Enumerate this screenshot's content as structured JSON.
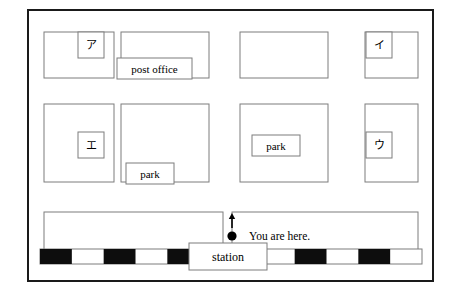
{
  "figure": {
    "question_number": "4",
    "type": "town-map-diagram",
    "frame": {
      "x": 28,
      "y": 10,
      "width": 405,
      "height": 271,
      "stroke": "#1a1a1a",
      "stroke_width": 2
    },
    "colors": {
      "block_outline": "#7d7d7d",
      "label_box_outline": "#7d7d7d",
      "frame": "#1a1a1a",
      "rail_dark": "#0d0d0d",
      "rail_light": "#ffffff",
      "marker": "#000000",
      "background": "#ffffff"
    }
  },
  "blocks": [
    {
      "name": "block-top-left",
      "x": 44,
      "y": 32,
      "width": 70,
      "height": 46
    },
    {
      "name": "block-top-center",
      "x": 121,
      "y": 32,
      "width": 88,
      "height": 46
    },
    {
      "name": "block-top-right-inner",
      "x": 240,
      "y": 32,
      "width": 88,
      "height": 46
    },
    {
      "name": "block-top-right",
      "x": 365,
      "y": 32,
      "width": 53,
      "height": 46
    },
    {
      "name": "block-mid-left",
      "x": 44,
      "y": 104,
      "width": 70,
      "height": 78
    },
    {
      "name": "block-mid-center",
      "x": 121,
      "y": 104,
      "width": 88,
      "height": 78
    },
    {
      "name": "block-mid-right-inner",
      "x": 240,
      "y": 104,
      "width": 88,
      "height": 78
    },
    {
      "name": "block-mid-right",
      "x": 365,
      "y": 104,
      "width": 53,
      "height": 78
    },
    {
      "name": "block-lower-left",
      "x": 44,
      "y": 212,
      "width": 179,
      "height": 46
    },
    {
      "name": "block-lower-right",
      "x": 232,
      "y": 212,
      "width": 186,
      "height": 46
    }
  ],
  "labels": [
    {
      "name": "label-a-kana",
      "text": "ア",
      "box": {
        "x": 78,
        "y": 32,
        "width": 26,
        "height": 26
      },
      "kana": true
    },
    {
      "name": "label-i-kana",
      "text": "イ",
      "box": {
        "x": 366,
        "y": 32,
        "width": 26,
        "height": 26
      },
      "kana": true
    },
    {
      "name": "label-e-kana",
      "text": "エ",
      "box": {
        "x": 78,
        "y": 132,
        "width": 26,
        "height": 26
      },
      "kana": true
    },
    {
      "name": "label-u-kana",
      "text": "ウ",
      "box": {
        "x": 366,
        "y": 132,
        "width": 26,
        "height": 26
      },
      "kana": true
    },
    {
      "name": "label-post-office",
      "text": "post office",
      "box": {
        "x": 117,
        "y": 58,
        "width": 75,
        "height": 21
      },
      "kana": false
    },
    {
      "name": "label-park-lower",
      "text": "park",
      "box": {
        "x": 126,
        "y": 163,
        "width": 48,
        "height": 21
      },
      "kana": false
    },
    {
      "name": "label-park-upper",
      "text": "park",
      "box": {
        "x": 252,
        "y": 135,
        "width": 48,
        "height": 21
      },
      "kana": false
    }
  ],
  "station": {
    "name": "station-box",
    "text": "station",
    "box": {
      "x": 189,
      "y": 243,
      "width": 78,
      "height": 27
    }
  },
  "you_are_here": {
    "name": "you-are-here-annotation",
    "text": "You are here.",
    "text_x": 249,
    "text_y": 240,
    "marker_dot": {
      "cx": 232,
      "cy": 236,
      "r": 4.6
    },
    "arrow": {
      "x": 232,
      "y_top": 213,
      "y_bottom": 228
    }
  },
  "railway": {
    "name": "railway-track",
    "y": 249,
    "height": 15,
    "x_start": 40,
    "x_end": 422,
    "segment_width": 31.833,
    "segment_count": 12,
    "first_segment_dark": true
  }
}
